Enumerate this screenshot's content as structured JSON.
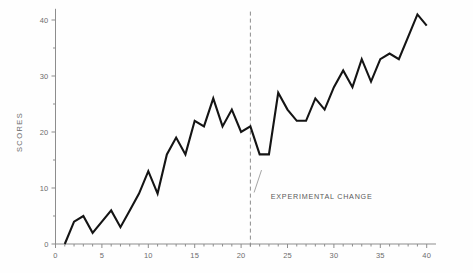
{
  "chart_data": {
    "type": "line",
    "title": "",
    "xlabel": "",
    "ylabel": "SCORES",
    "xlim": [
      0,
      41
    ],
    "ylim": [
      0,
      42
    ],
    "grid": false,
    "legend": false,
    "x_ticks": [
      0,
      5,
      10,
      15,
      20,
      25,
      30,
      35,
      40
    ],
    "x_tick_labels": [
      "0",
      "5",
      "10",
      "15",
      "20",
      "25",
      "30",
      "35",
      "40"
    ],
    "x_minor_ticks": [
      1,
      2,
      3,
      4,
      6,
      7,
      8,
      9,
      11,
      12,
      13,
      14,
      16,
      17,
      18,
      19,
      21,
      22,
      23,
      24,
      26,
      27,
      28,
      29,
      31,
      32,
      33,
      34,
      36,
      37,
      38,
      39
    ],
    "y_ticks": [
      0,
      10,
      20,
      30,
      40
    ],
    "y_tick_labels": [
      "0",
      "10",
      "20",
      "30",
      "40"
    ],
    "y_minor_ticks": [
      5,
      15,
      25,
      35
    ],
    "series": [
      {
        "name": "scores",
        "color": "#141414",
        "x": [
          1,
          2,
          3,
          4,
          5,
          6,
          7,
          8,
          9,
          10,
          11,
          12,
          13,
          14,
          15,
          16,
          17,
          18,
          19,
          20,
          21,
          22,
          23,
          24,
          25,
          26,
          27,
          28,
          29,
          30,
          31,
          32,
          33,
          34,
          35,
          36,
          37,
          38,
          39,
          40
        ],
        "values": [
          0,
          4,
          5,
          2,
          4,
          6,
          3,
          6,
          9,
          13,
          9,
          16,
          19,
          16,
          22,
          21,
          26,
          21,
          24,
          20,
          21,
          16,
          16,
          27,
          24,
          22,
          22,
          26,
          24,
          28,
          31,
          28,
          33,
          29,
          33,
          34,
          33,
          37,
          41,
          39
        ]
      }
    ],
    "annotations": [
      {
        "name": "experimental-change",
        "text": "EXPERIMENTAL  CHANGE",
        "x": 23.2,
        "y": 8.0,
        "divider_x": 21.0,
        "leader_from": [
          22.2,
          13.2
        ],
        "leader_to": [
          21.4,
          9.2
        ]
      }
    ]
  },
  "axes": {
    "y_axis_title": "SCORES"
  }
}
